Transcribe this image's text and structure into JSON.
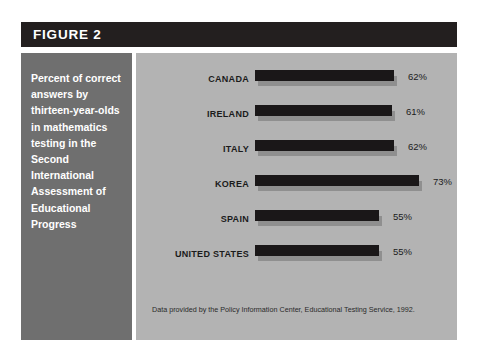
{
  "figure": {
    "header_label": "FIGURE 2",
    "caption": "Percent of correct answers by thirteen-year-olds in mathematics testing in the Second International Assessment of Educational Progress",
    "source_note": "Data provided by the Policy Information Center, Educational Testing Service, 1992."
  },
  "colors": {
    "header_band": "#231f1f",
    "caption_panel": "#6f6f6f",
    "chart_panel": "#b3b3b3",
    "bar_fill": "#1a1718",
    "bar_shadow": "#8f8f8f",
    "page_background": "#ffffff",
    "header_text": "#ffffff",
    "caption_text": "#ffffff",
    "chart_text": "#1b1b1b"
  },
  "chart_data": {
    "type": "bar",
    "orientation": "horizontal",
    "title": "FIGURE 2",
    "subtitle": "Percent of correct answers by thirteen-year-olds in mathematics testing in the Second International Assessment of Educational Progress",
    "xlabel": "",
    "ylabel": "",
    "xlim": [
      0,
      100
    ],
    "grid": false,
    "legend": false,
    "annotation": "Data provided by the Policy Information Center, Educational Testing Service, 1992.",
    "categories": [
      "CANADA",
      "IRELAND",
      "ITALY",
      "KOREA",
      "SPAIN",
      "UNITED STATES"
    ],
    "values": [
      62,
      61,
      62,
      73,
      55,
      55
    ],
    "value_labels": [
      "62%",
      "61%",
      "62%",
      "73%",
      "55%",
      "55%"
    ]
  }
}
